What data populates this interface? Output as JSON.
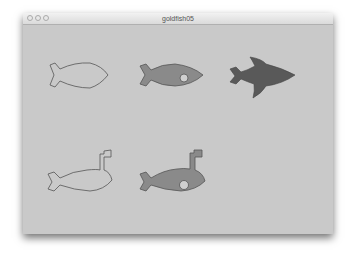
{
  "window": {
    "title": "goldfish05",
    "buttons": [
      "close",
      "minimize",
      "zoom"
    ]
  },
  "canvas": {
    "background": "#c9c9c9",
    "fill_color": "#8a8a8a",
    "dark_fill_color": "#595959",
    "stroke_color": "#555555",
    "shapes": [
      {
        "name": "fish-outline",
        "row": 1,
        "col": 1
      },
      {
        "name": "fish-filled-with-eye",
        "row": 1,
        "col": 2
      },
      {
        "name": "fish-dark-with-fins",
        "row": 1,
        "col": 3
      },
      {
        "name": "fish-outline-with-periscope",
        "row": 2,
        "col": 1
      },
      {
        "name": "fish-filled-with-eye-and-periscope",
        "row": 2,
        "col": 2
      }
    ]
  }
}
